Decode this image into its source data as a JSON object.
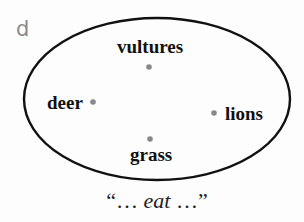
{
  "panel": {
    "label": "d"
  },
  "set": {
    "shape": "ellipse",
    "stroke_color": "#111111",
    "point_color": "#888888",
    "elements": [
      {
        "id": "vultures",
        "label": "vultures"
      },
      {
        "id": "deer",
        "label": "deer"
      },
      {
        "id": "lions",
        "label": "lions"
      },
      {
        "id": "grass",
        "label": "grass"
      }
    ]
  },
  "caption": {
    "open_quote": "“",
    "leading_ellipsis": "… ",
    "verb": "eat",
    "trailing_ellipsis": " …",
    "close_quote": "”"
  }
}
